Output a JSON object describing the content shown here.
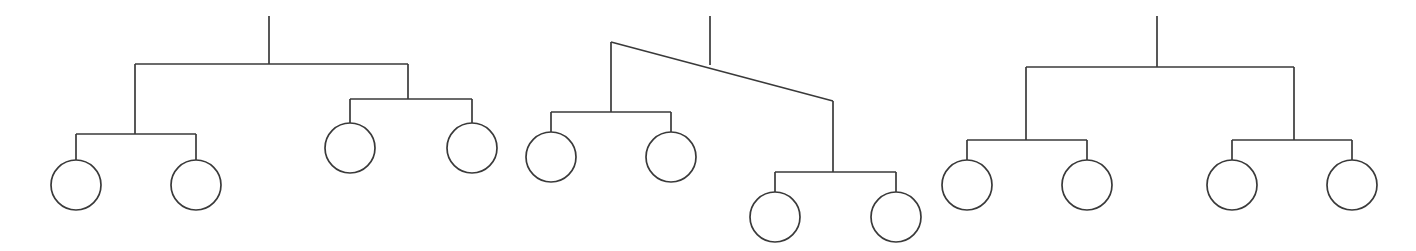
{
  "canvas": {
    "width": 1416,
    "height": 251,
    "background": "#ffffff",
    "stroke_color": "#3a3a3a",
    "stroke_width": 1.7,
    "title": "Three hierarchical binary tree diagrams with circular leaf nodes"
  },
  "diagram": {
    "type": "tree-diagram",
    "tree_count": 3,
    "leaf_radius": 25,
    "leaf_total": 12
  },
  "trees": [
    {
      "id": "tree-1",
      "name": "left-tree",
      "root_stem": {
        "x": 269,
        "y1": 16,
        "y2": 64
      },
      "root_bar": {
        "x1": 135,
        "x2": 408,
        "y": 64
      },
      "branches": [
        {
          "id": "tree-1-branch-left",
          "stem_x": 135,
          "stem_y1": 64,
          "stem_y2": 134,
          "bar_y": 134,
          "bar_x1": 76,
          "bar_x2": 196,
          "leaf_drop_y2": 160,
          "leaf_cy": 185,
          "leaves": [
            {
              "cx": 76,
              "cy": 185
            },
            {
              "cx": 196,
              "cy": 185
            }
          ]
        },
        {
          "id": "tree-1-branch-right",
          "stem_x": 408,
          "stem_y1": 64,
          "stem_y2": 99,
          "bar_y": 99,
          "bar_x1": 350,
          "bar_x2": 472,
          "leaf_drop_y2": 123,
          "leaf_cy": 148,
          "leaves": [
            {
              "cx": 350,
              "cy": 148
            },
            {
              "cx": 472,
              "cy": 148
            }
          ]
        }
      ]
    },
    {
      "id": "tree-2",
      "name": "middle-tree-slanted",
      "root_stem": {
        "x": 710,
        "y1": 16,
        "y2": 65
      },
      "root_bar_slanted": {
        "x1": 611,
        "y1": 42,
        "x2": 833,
        "y2": 101
      },
      "branches": [
        {
          "id": "tree-2-branch-left",
          "stem_x": 611,
          "stem_y1": 42,
          "stem_y2": 112,
          "bar_y": 112,
          "bar_x1": 551,
          "bar_x2": 671,
          "leaf_drop_y2": 132,
          "leaf_cy": 157,
          "leaves": [
            {
              "cx": 551,
              "cy": 157
            },
            {
              "cx": 671,
              "cy": 157
            }
          ]
        },
        {
          "id": "tree-2-branch-right",
          "stem_x": 833,
          "stem_y1": 101,
          "stem_y2": 172,
          "bar_y": 172,
          "bar_x1": 775,
          "bar_x2": 896,
          "leaf_drop_y2": 192,
          "leaf_cy": 217,
          "leaves": [
            {
              "cx": 775,
              "cy": 217
            },
            {
              "cx": 896,
              "cy": 217
            }
          ]
        }
      ]
    },
    {
      "id": "tree-3",
      "name": "right-tree",
      "root_stem": {
        "x": 1157,
        "y1": 16,
        "y2": 67
      },
      "root_bar": {
        "x1": 1026,
        "x2": 1294,
        "y": 67
      },
      "branches": [
        {
          "id": "tree-3-branch-left",
          "stem_x": 1026,
          "stem_y1": 67,
          "stem_y2": 140,
          "bar_y": 140,
          "bar_x1": 967,
          "bar_x2": 1087,
          "leaf_drop_y2": 160,
          "leaf_cy": 185,
          "leaves": [
            {
              "cx": 967,
              "cy": 185
            },
            {
              "cx": 1087,
              "cy": 185
            }
          ]
        },
        {
          "id": "tree-3-branch-right",
          "stem_x": 1294,
          "stem_y1": 67,
          "stem_y2": 140,
          "bar_y": 140,
          "bar_x1": 1232,
          "bar_x2": 1352,
          "leaf_drop_y2": 160,
          "leaf_cy": 185,
          "leaves": [
            {
              "cx": 1232,
              "cy": 185
            },
            {
              "cx": 1352,
              "cy": 185
            }
          ]
        }
      ]
    }
  ]
}
